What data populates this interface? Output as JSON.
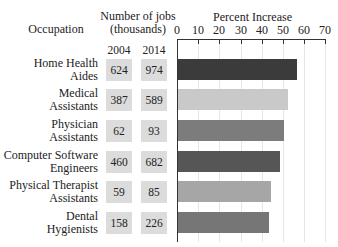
{
  "headers": {
    "occupation": "Occupation",
    "jobs_line1": "Number of jobs",
    "jobs_line2": "(thousands)",
    "year_a": "2004",
    "year_b": "2014",
    "percent": "Percent Increase"
  },
  "axis": {
    "ticks": [
      "0",
      "10",
      "20",
      "30",
      "40",
      "50",
      "60",
      "70"
    ]
  },
  "rows": [
    {
      "line1": "Home Health",
      "line2": "Aides",
      "y2004": "624",
      "y2014": "974",
      "pct": 56,
      "color": "#3b3b3b"
    },
    {
      "line1": "Medical",
      "line2": "Assistants",
      "y2004": "387",
      "y2014": "589",
      "pct": 52,
      "color": "#c9c9c9"
    },
    {
      "line1": "Physician",
      "line2": "Assistants",
      "y2004": "62",
      "y2014": "93",
      "pct": 50,
      "color": "#7c7c7c"
    },
    {
      "line1": "Computer Software",
      "line2": "Engineers",
      "y2004": "460",
      "y2014": "682",
      "pct": 48,
      "color": "#565656"
    },
    {
      "line1": "Physical Therapist",
      "line2": "Assistants",
      "y2004": "59",
      "y2014": "85",
      "pct": 44,
      "color": "#a6a6a6"
    },
    {
      "line1": "Dental",
      "line2": "Hygienists",
      "y2004": "158",
      "y2014": "226",
      "pct": 43,
      "color": "#767676"
    }
  ],
  "chart_data": {
    "type": "bar",
    "orientation": "horizontal",
    "title": "",
    "xlabel": "Percent Increase",
    "ylabel": "Occupation",
    "xlim": [
      0,
      70
    ],
    "x_ticks": [
      0,
      10,
      20,
      30,
      40,
      50,
      60,
      70
    ],
    "grid": true,
    "categories": [
      "Home Health Aides",
      "Medical Assistants",
      "Physician Assistants",
      "Computer Software Engineers",
      "Physical Therapist Assistants",
      "Dental Hygienists"
    ],
    "series": [
      {
        "name": "Percent Increase",
        "values": [
          56,
          52,
          50,
          48,
          44,
          43
        ]
      }
    ],
    "table": {
      "title": "Number of jobs (thousands)",
      "columns": [
        "2004",
        "2014"
      ],
      "values": [
        [
          624,
          974
        ],
        [
          387,
          589
        ],
        [
          62,
          93
        ],
        [
          460,
          682
        ],
        [
          59,
          85
        ],
        [
          158,
          226
        ]
      ]
    }
  }
}
